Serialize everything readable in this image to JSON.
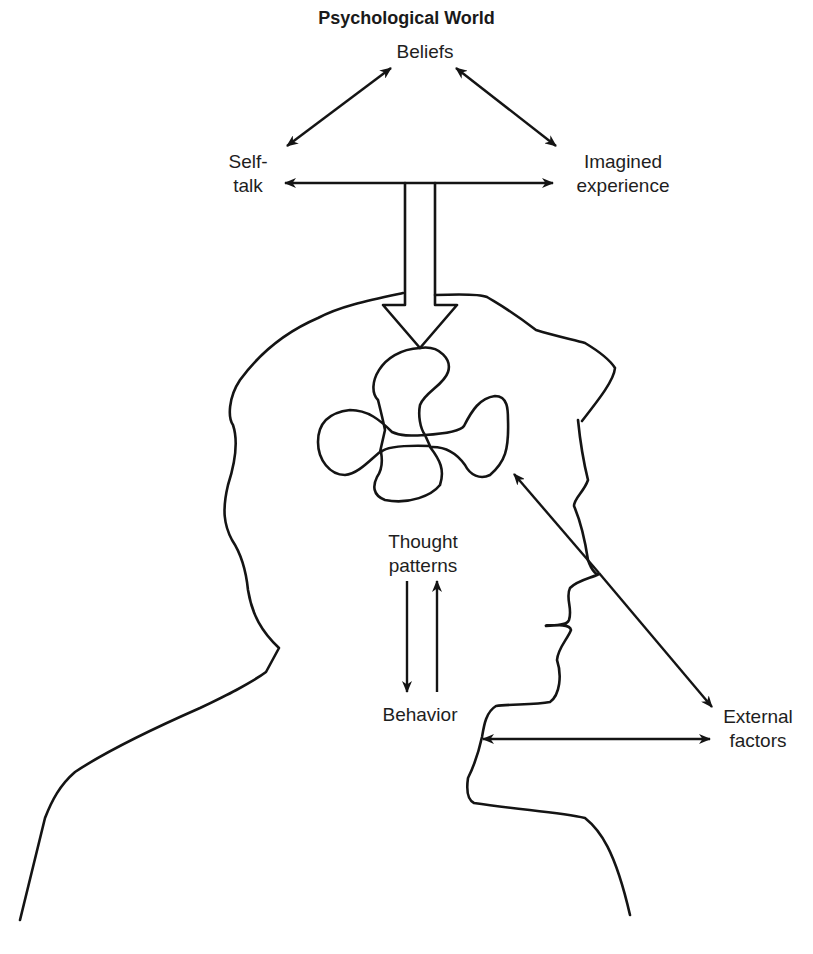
{
  "figure": {
    "title": "Psychological World",
    "labels": {
      "beliefs": "Beliefs",
      "self_talk_line1": "Self-",
      "self_talk_line2": "talk",
      "imagined_line1": "Imagined",
      "imagined_line2": "experience",
      "thought_line1": "Thought",
      "thought_line2": "patterns",
      "behavior": "Behavior",
      "external_line1": "External",
      "external_line2": "factors"
    },
    "colors": {
      "ink": "#141414",
      "background": "#ffffff"
    }
  },
  "diagram": {
    "nodes": [
      "Beliefs",
      "Self-talk",
      "Imagined experience",
      "Thought patterns",
      "Behavior",
      "External factors"
    ],
    "edges": [
      {
        "from": "Beliefs",
        "to": "Self-talk",
        "type": "bidirectional"
      },
      {
        "from": "Beliefs",
        "to": "Imagined experience",
        "type": "bidirectional"
      },
      {
        "from": "Self-talk",
        "to": "Imagined experience",
        "type": "bidirectional"
      },
      {
        "from": "Psychological World",
        "to": "Brain",
        "type": "block-arrow"
      },
      {
        "from": "Thought patterns",
        "to": "Behavior",
        "type": "directed"
      },
      {
        "from": "Behavior",
        "to": "Thought patterns",
        "type": "directed"
      },
      {
        "from": "External factors",
        "to": "Brain",
        "type": "directed"
      },
      {
        "from": "Face",
        "to": "External factors",
        "type": "directed"
      },
      {
        "from": "Neck",
        "to": "External factors",
        "type": "bidirectional"
      }
    ]
  }
}
